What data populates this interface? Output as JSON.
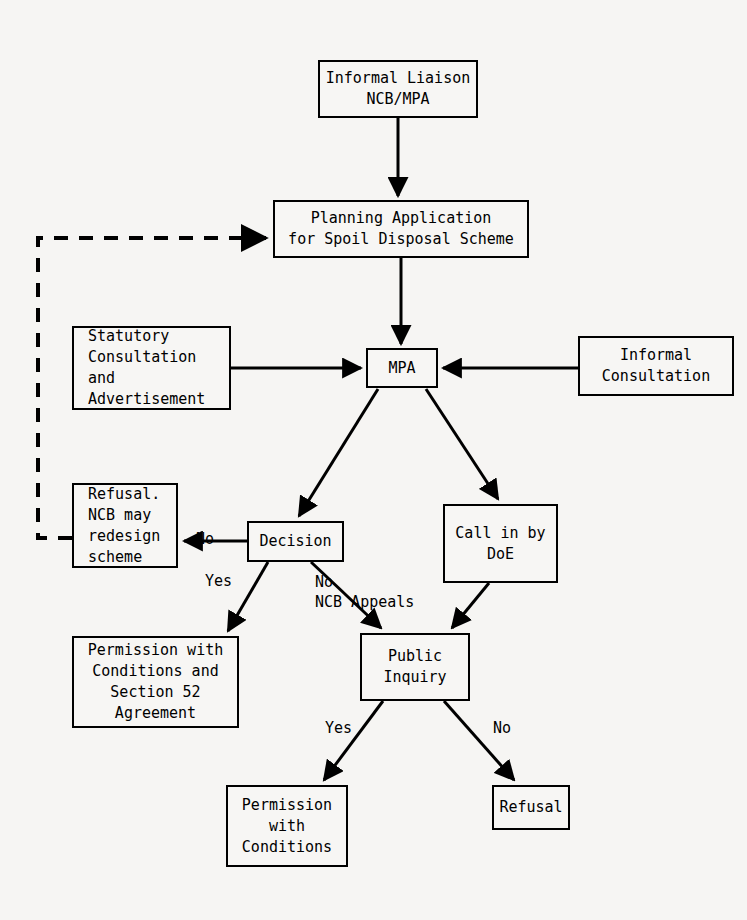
{
  "diagram": {
    "background_color": "#f6f5f3",
    "line_color": "#000000",
    "nodes": [
      {
        "id": "informal-liaison",
        "label": "Informal Liaison\nNCB/MPA",
        "x": 318,
        "y": 60,
        "w": 160,
        "h": 58,
        "align": "center"
      },
      {
        "id": "planning-application",
        "label": "Planning Application\nfor Spoil Disposal Scheme",
        "x": 273,
        "y": 200,
        "w": 256,
        "h": 58,
        "align": "center"
      },
      {
        "id": "statutory-consultation",
        "label": "Statutory\nConsultation\nand\nAdvertisement",
        "x": 72,
        "y": 326,
        "w": 159,
        "h": 84,
        "align": "left"
      },
      {
        "id": "mpa",
        "label": "MPA",
        "x": 366,
        "y": 348,
        "w": 72,
        "h": 40,
        "align": "center"
      },
      {
        "id": "informal-consultation",
        "label": "Informal\nConsultation",
        "x": 578,
        "y": 336,
        "w": 156,
        "h": 60,
        "align": "center"
      },
      {
        "id": "refusal-redesign",
        "label": "Refusal.\nNCB may\nredesign\nscheme",
        "x": 72,
        "y": 483,
        "w": 106,
        "h": 85,
        "align": "left"
      },
      {
        "id": "decision",
        "label": "Decision",
        "x": 247,
        "y": 521,
        "w": 97,
        "h": 41,
        "align": "center"
      },
      {
        "id": "call-in-doe",
        "label": "Call in by\nDoE",
        "x": 443,
        "y": 504,
        "w": 115,
        "h": 79,
        "align": "center"
      },
      {
        "id": "permission-section52",
        "label": "Permission with\nConditions and\nSection 52\nAgreement",
        "x": 72,
        "y": 636,
        "w": 167,
        "h": 92,
        "align": "center"
      },
      {
        "id": "public-inquiry",
        "label": "Public\nInquiry",
        "x": 360,
        "y": 633,
        "w": 110,
        "h": 68,
        "align": "center"
      },
      {
        "id": "permission-conditions",
        "label": "Permission\nwith\nConditions",
        "x": 226,
        "y": 785,
        "w": 122,
        "h": 82,
        "align": "center"
      },
      {
        "id": "refusal",
        "label": "Refusal",
        "x": 492,
        "y": 785,
        "w": 78,
        "h": 45,
        "align": "center"
      }
    ],
    "edges": [
      {
        "id": "e-liaison-to-application",
        "from": "informal-liaison",
        "to": "planning-application",
        "style": "solid",
        "label": ""
      },
      {
        "id": "e-feedback-refusal-to-app",
        "from": "refusal-redesign",
        "to": "planning-application",
        "style": "dashed",
        "label": ""
      },
      {
        "id": "e-application-to-mpa",
        "from": "planning-application",
        "to": "mpa",
        "style": "solid",
        "label": ""
      },
      {
        "id": "e-statutory-to-mpa",
        "from": "statutory-consultation",
        "to": "mpa",
        "style": "solid",
        "label": ""
      },
      {
        "id": "e-informalcons-to-mpa",
        "from": "informal-consultation",
        "to": "mpa",
        "style": "solid",
        "label": ""
      },
      {
        "id": "e-mpa-to-decision",
        "from": "mpa",
        "to": "decision",
        "style": "solid",
        "label": ""
      },
      {
        "id": "e-mpa-to-callin",
        "from": "mpa",
        "to": "call-in-doe",
        "style": "solid",
        "label": ""
      },
      {
        "id": "e-decision-to-refusal",
        "from": "decision",
        "to": "refusal-redesign",
        "style": "solid",
        "label": "No"
      },
      {
        "id": "e-decision-to-permission52",
        "from": "decision",
        "to": "permission-section52",
        "style": "solid",
        "label": "Yes"
      },
      {
        "id": "e-decision-to-inquiry",
        "from": "decision",
        "to": "public-inquiry",
        "style": "solid",
        "label": "No\nNCB Appeals"
      },
      {
        "id": "e-callin-to-inquiry",
        "from": "call-in-doe",
        "to": "public-inquiry",
        "style": "solid",
        "label": ""
      },
      {
        "id": "e-inquiry-to-permission",
        "from": "public-inquiry",
        "to": "permission-conditions",
        "style": "solid",
        "label": "Yes"
      },
      {
        "id": "e-inquiry-to-refusal",
        "from": "public-inquiry",
        "to": "refusal",
        "style": "solid",
        "label": "No"
      }
    ],
    "edge_labels": [
      {
        "id": "lbl-decision-no",
        "text": "No",
        "x": 196,
        "y": 529
      },
      {
        "id": "lbl-decision-yes",
        "text": "Yes",
        "x": 205,
        "y": 571
      },
      {
        "id": "lbl-appeals-no",
        "text": "No",
        "x": 315,
        "y": 572
      },
      {
        "id": "lbl-appeals-ncb",
        "text": "NCB Appeals",
        "x": 315,
        "y": 592
      },
      {
        "id": "lbl-inquiry-yes",
        "text": "Yes",
        "x": 325,
        "y": 718
      },
      {
        "id": "lbl-inquiry-no",
        "text": "No",
        "x": 493,
        "y": 718
      }
    ]
  }
}
